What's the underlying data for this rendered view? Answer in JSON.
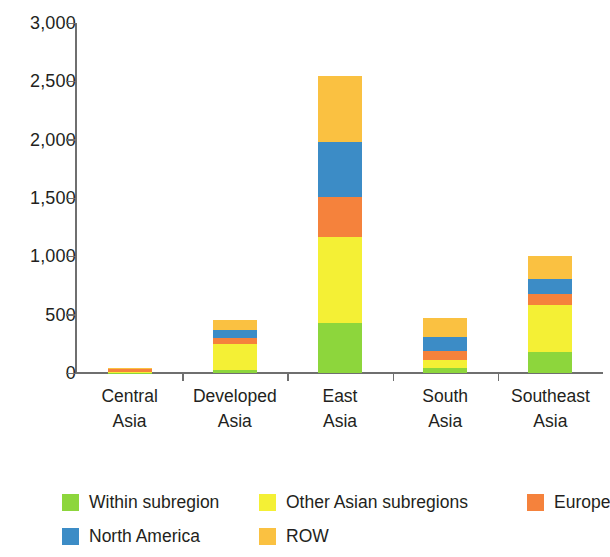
{
  "chart_data": {
    "type": "bar",
    "subtype": "stacked-bar",
    "title": "",
    "subtitle": "",
    "xlabel": "",
    "ylabel": "",
    "ylim": [
      0,
      3000
    ],
    "ytick_labels": [
      "3,000",
      "2,500",
      "2,000",
      "1,500",
      "1,000",
      "500",
      "0"
    ],
    "ytick_values": [
      3000,
      2500,
      2000,
      1500,
      1000,
      500,
      0
    ],
    "grid": false,
    "legend_position": "bottom",
    "categories": [
      "Central Asia",
      "Developed Asia",
      "East Asia",
      "South Asia",
      "Southeast Asia"
    ],
    "category_lines": [
      [
        "Central",
        "Asia"
      ],
      [
        "Developed",
        "Asia"
      ],
      [
        "East",
        "Asia"
      ],
      [
        "South",
        "Asia"
      ],
      [
        "Southeast",
        "Asia"
      ]
    ],
    "series": [
      {
        "name": "Within subregion",
        "color": "#8DD63C",
        "values": [
          3,
          30,
          430,
          45,
          180
        ]
      },
      {
        "name": "Other Asian subregions",
        "color": "#F4F035",
        "values": [
          2,
          215,
          735,
          65,
          400
        ]
      },
      {
        "name": "Europe",
        "color": "#F5823C",
        "values": [
          30,
          55,
          345,
          75,
          95
        ]
      },
      {
        "name": "North America",
        "color": "#3C8CC6",
        "values": [
          3,
          70,
          470,
          125,
          135
        ]
      },
      {
        "name": "ROW",
        "color": "#FAC141",
        "values": [
          2,
          85,
          565,
          160,
          195
        ]
      }
    ],
    "totals": [
      40,
      455,
      2545,
      470,
      1005
    ]
  },
  "legend": {
    "items": [
      {
        "label": "Within subregion",
        "color": "#8DD63C"
      },
      {
        "label": "Other Asian subregions",
        "color": "#F4F035"
      },
      {
        "label": "Europe",
        "color": "#F5823C"
      },
      {
        "label": "North America",
        "color": "#3C8CC6"
      },
      {
        "label": "ROW",
        "color": "#FAC141"
      }
    ]
  },
  "axis": {
    "color": "#6F6F6F"
  }
}
